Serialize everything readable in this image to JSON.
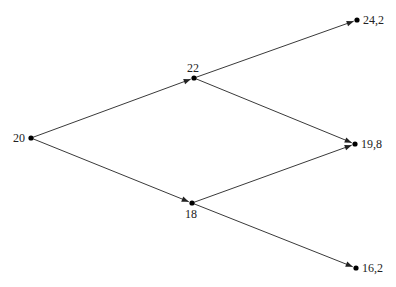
{
  "diagram": {
    "type": "binomial-tree",
    "nodes": [
      {
        "id": "root",
        "label": "20",
        "level": 0
      },
      {
        "id": "up",
        "label": "22",
        "level": 1
      },
      {
        "id": "down",
        "label": "18",
        "level": 1
      },
      {
        "id": "uu",
        "label": "24,2",
        "level": 2
      },
      {
        "id": "ud",
        "label": "19,8",
        "level": 2
      },
      {
        "id": "dd",
        "label": "16,2",
        "level": 2
      }
    ],
    "edges": [
      {
        "from": "root",
        "to": "up"
      },
      {
        "from": "root",
        "to": "down"
      },
      {
        "from": "up",
        "to": "uu"
      },
      {
        "from": "up",
        "to": "ud"
      },
      {
        "from": "down",
        "to": "ud"
      },
      {
        "from": "down",
        "to": "dd"
      }
    ]
  }
}
